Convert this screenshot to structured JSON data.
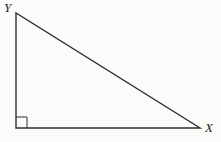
{
  "figure": {
    "vertex_labels": {
      "top_left": "Y",
      "bottom_right": "X"
    },
    "right_angle_marker": "small square at bottom-left interior corner",
    "colors": {
      "line": "#2f2f2f",
      "label": "#1c1c1c",
      "background": "#fbfbfa"
    }
  }
}
